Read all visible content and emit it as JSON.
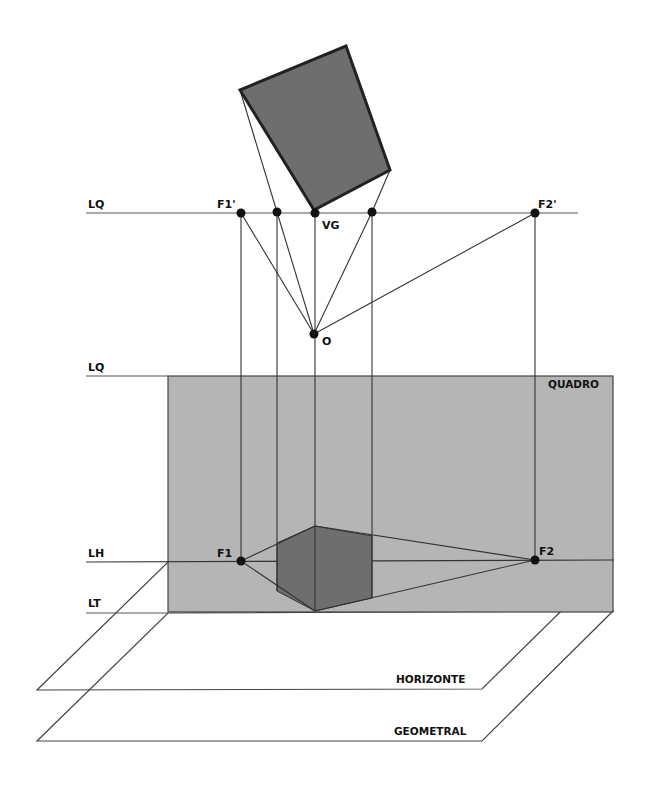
{
  "colors": {
    "background": "#ffffff",
    "quadro_fill": "#b5b5b5",
    "shape_fill": "#6e6e6e",
    "line": "#333333",
    "point": "#111111"
  },
  "labels": {
    "lq_top": "LQ",
    "lq_mid": "LQ",
    "lh": "LH",
    "lt": "LT",
    "f1_prime": "F1'",
    "f2_prime": "F2'",
    "vg": "VG",
    "o": "O",
    "f1": "F1",
    "f2": "F2",
    "quadro": "QUADRO",
    "horizonte": "HORIZONTE",
    "geometral": "GEOMETRAL"
  }
}
